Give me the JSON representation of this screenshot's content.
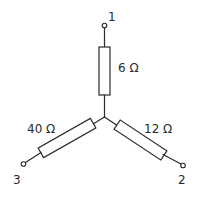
{
  "diagram": {
    "type": "star (Y) resistor network",
    "colors": {
      "line": "#2a2a2a",
      "background": "#ffffff"
    },
    "resistors": [
      {
        "id": "r1",
        "value_label": "6 Ω",
        "branch": "to terminal 1"
      },
      {
        "id": "r2",
        "value_label": "12 Ω",
        "branch": "to terminal 2"
      },
      {
        "id": "r3",
        "value_label": "40 Ω",
        "branch": "to terminal 3"
      }
    ],
    "terminals": [
      {
        "id": "t1",
        "label": "1"
      },
      {
        "id": "t2",
        "label": "2"
      },
      {
        "id": "t3",
        "label": "3"
      }
    ]
  }
}
